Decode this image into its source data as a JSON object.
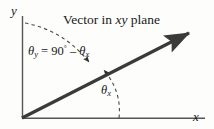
{
  "figure": {
    "caption_prefix": "Vector in ",
    "caption_italic": "xy",
    "caption_suffix": " plane",
    "background_color": "#fdfdfc"
  },
  "axes": {
    "y_label": "y",
    "x_label": "x",
    "color": "#555555",
    "origin": {
      "x": 22,
      "y": 118
    },
    "y_top": {
      "x": 22,
      "y": 16
    },
    "x_right": {
      "x": 205,
      "y": 118
    }
  },
  "vector": {
    "color": "#3a3a3a",
    "start": {
      "x": 22,
      "y": 118
    },
    "tip": {
      "x": 193,
      "y": 31
    },
    "width": 3.2,
    "arrowhead": "solid-triangle"
  },
  "angle_arc": {
    "style": "dashed",
    "color": "#4a4a4a",
    "from_axis": "y",
    "to_axis": "x",
    "arrowheads": "double",
    "start": {
      "x": 25,
      "y": 23
    },
    "end": {
      "x": 121,
      "y": 118
    }
  },
  "labels": {
    "theta_y_equation": {
      "theta": "θ",
      "subscript": "y",
      "equals": " = ",
      "value": "90",
      "degree": "°",
      "minus": " – ",
      "theta2": "θ",
      "subscript2": "x"
    },
    "theta_x": {
      "theta": "θ",
      "subscript": "x"
    }
  }
}
